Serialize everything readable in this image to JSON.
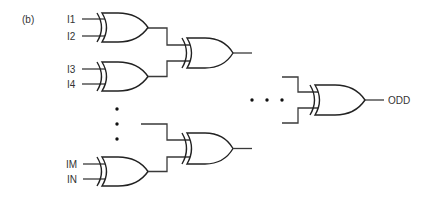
{
  "figure": {
    "panel_label": "(b)"
  },
  "inputs": [
    {
      "label": "I1"
    },
    {
      "label": "I2"
    },
    {
      "label": "I3"
    },
    {
      "label": "I4"
    },
    {
      "label": "IM"
    },
    {
      "label": "IN"
    }
  ],
  "gates": [
    {
      "id": "xor-i1-i2",
      "type": "XOR",
      "level": 1
    },
    {
      "id": "xor-i3-i4",
      "type": "XOR",
      "level": 1
    },
    {
      "id": "xor-im-in",
      "type": "XOR",
      "level": 1
    },
    {
      "id": "xor-level2-top",
      "type": "XOR",
      "level": 2
    },
    {
      "id": "xor-level2-bottom",
      "type": "XOR",
      "level": 2
    },
    {
      "id": "xor-final",
      "type": "XOR",
      "level": "final"
    }
  ],
  "output": {
    "label": "ODD"
  },
  "ellipsis": {
    "vertical": "⋮",
    "horizontal": "⋯"
  },
  "colors": {
    "line": "#222222",
    "text": "#333333",
    "background": "#ffffff"
  }
}
